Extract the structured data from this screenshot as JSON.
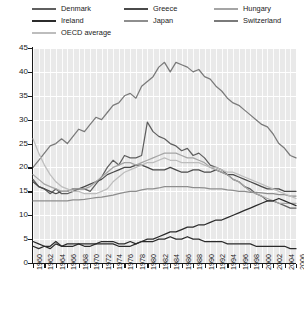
{
  "legend": {
    "columns": [
      [
        {
          "label": "Denmark",
          "color": "#5f5f5f",
          "key": "denmark"
        },
        {
          "label": "Ireland",
          "color": "#2b2b2b",
          "key": "ireland"
        },
        {
          "label": "OECD average",
          "color": "#bdbdbd",
          "key": "oecd_average"
        }
      ],
      [
        {
          "label": "Greece",
          "color": "#4a4a4a",
          "key": "greece"
        },
        {
          "label": "Japan",
          "color": "#8e8e8e",
          "key": "japan"
        }
      ],
      [
        {
          "label": "Hungary",
          "color": "#a5a5a5",
          "key": "hungary"
        },
        {
          "label": "Switzerland",
          "color": "#7a7a7a",
          "key": "switzerland"
        }
      ]
    ]
  },
  "chart_data": {
    "type": "line",
    "title": "",
    "xlabel": "",
    "ylabel": "",
    "xlim": [
      1960,
      2006
    ],
    "ylim": [
      0,
      45
    ],
    "ytick_step": 5,
    "yticks": [
      0,
      5,
      10,
      15,
      20,
      25,
      30,
      35,
      40,
      45
    ],
    "grid": true,
    "legend_position": "top",
    "x": [
      1960,
      1961,
      1962,
      1963,
      1964,
      1965,
      1966,
      1967,
      1968,
      1969,
      1970,
      1971,
      1972,
      1973,
      1974,
      1975,
      1976,
      1977,
      1978,
      1979,
      1980,
      1981,
      1982,
      1983,
      1984,
      1985,
      1986,
      1987,
      1988,
      1989,
      1990,
      1991,
      1992,
      1993,
      1994,
      1995,
      1996,
      1997,
      1998,
      1999,
      2000,
      2001,
      2002,
      2003,
      2004,
      2005,
      2006
    ],
    "xticks": [
      1960,
      1962,
      1964,
      1966,
      1968,
      1970,
      1972,
      1974,
      1976,
      1978,
      1980,
      1982,
      1984,
      1986,
      1988,
      1990,
      1992,
      1994,
      1996,
      1998,
      2000,
      2002,
      2004,
      2006
    ],
    "xtick_labels": [
      "1960",
      "1962",
      "1964",
      "1966",
      "1968",
      "1970",
      "1972",
      "1974",
      "1976",
      "1978",
      "1980",
      "1982",
      "1984",
      "1986",
      "1988",
      "1990",
      "1992",
      "1994",
      "1996",
      "1998",
      "2000",
      "2002",
      "2004",
      "2006"
    ],
    "series": [
      {
        "name": "Switzerland",
        "color": "#7a7a7a",
        "values": [
          20.0,
          21.5,
          23.0,
          24.5,
          25.0,
          26.0,
          25.0,
          26.5,
          28.0,
          27.5,
          29.0,
          30.5,
          30.0,
          31.5,
          33.0,
          33.5,
          35.0,
          35.5,
          34.5,
          37.0,
          38.0,
          39.0,
          41.0,
          42.0,
          40.0,
          42.0,
          41.5,
          41.0,
          40.0,
          40.5,
          39.0,
          38.5,
          37.0,
          36.0,
          34.5,
          33.5,
          33.0,
          32.0,
          31.0,
          30.0,
          29.0,
          28.5,
          27.0,
          25.0,
          24.0,
          22.5,
          22.0
        ]
      },
      {
        "name": "Denmark",
        "color": "#5f5f5f",
        "values": [
          17.5,
          16.0,
          15.5,
          14.5,
          15.5,
          14.5,
          14.5,
          15.0,
          15.5,
          15.5,
          15.0,
          16.5,
          18.0,
          20.0,
          21.5,
          20.5,
          22.5,
          22.0,
          22.0,
          22.5,
          29.5,
          27.5,
          26.5,
          26.0,
          25.0,
          24.5,
          23.5,
          24.0,
          22.5,
          23.0,
          22.0,
          20.5,
          20.0,
          19.5,
          18.5,
          17.5,
          17.0,
          16.0,
          15.5,
          14.5,
          14.0,
          13.0,
          13.0,
          12.5,
          12.0,
          11.5,
          11.5
        ]
      },
      {
        "name": "Greece",
        "color": "#4a4a4a",
        "values": [
          17.0,
          16.0,
          15.5,
          15.0,
          14.5,
          15.0,
          15.0,
          15.5,
          15.5,
          16.0,
          16.5,
          17.0,
          17.5,
          18.5,
          19.0,
          19.5,
          20.0,
          20.0,
          20.5,
          20.5,
          20.0,
          19.5,
          19.5,
          19.5,
          20.0,
          19.5,
          19.0,
          19.0,
          19.5,
          19.5,
          19.0,
          19.0,
          19.5,
          19.0,
          18.5,
          18.5,
          18.0,
          17.5,
          17.0,
          16.5,
          16.0,
          15.5,
          15.5,
          15.5,
          15.0,
          15.0,
          15.0
        ]
      },
      {
        "name": "Hungary",
        "color": "#a5a5a5",
        "values": [
          18.5,
          17.5,
          16.5,
          16.0,
          15.5,
          15.0,
          15.0,
          15.5,
          15.5,
          15.5,
          16.0,
          17.0,
          18.0,
          19.0,
          20.0,
          20.5,
          21.0,
          21.0,
          20.5,
          21.0,
          21.5,
          22.0,
          22.5,
          23.0,
          23.0,
          23.0,
          22.5,
          22.0,
          22.0,
          21.5,
          21.0,
          20.0,
          19.5,
          19.0,
          18.5,
          17.5,
          17.0,
          16.0,
          15.0,
          14.5,
          14.0,
          13.5,
          13.0,
          12.5,
          12.5,
          12.5,
          12.5
        ]
      },
      {
        "name": "Japan",
        "color": "#8e8e8e",
        "values": [
          13.0,
          13.0,
          13.0,
          13.0,
          13.0,
          13.0,
          13.0,
          13.2,
          13.2,
          13.3,
          13.5,
          13.7,
          13.8,
          14.0,
          14.2,
          14.5,
          14.8,
          15.0,
          15.0,
          15.3,
          15.5,
          15.5,
          15.7,
          16.0,
          16.0,
          16.0,
          16.0,
          16.0,
          15.8,
          15.8,
          15.7,
          15.5,
          15.5,
          15.5,
          15.3,
          15.2,
          15.0,
          15.0,
          14.8,
          14.8,
          14.7,
          14.5,
          14.5,
          14.3,
          14.3,
          14.0,
          14.0
        ]
      },
      {
        "name": "OECD average",
        "color": "#bdbdbd",
        "values": [
          26.0,
          23.0,
          20.5,
          18.5,
          17.0,
          16.0,
          15.5,
          15.0,
          15.0,
          14.5,
          14.5,
          14.5,
          15.0,
          15.5,
          17.0,
          18.0,
          19.0,
          19.5,
          20.0,
          20.5,
          21.0,
          21.0,
          21.5,
          22.0,
          21.5,
          21.5,
          21.0,
          21.0,
          21.0,
          21.0,
          20.5,
          20.0,
          20.0,
          19.5,
          19.0,
          19.0,
          18.5,
          18.0,
          17.5,
          17.0,
          16.5,
          16.0,
          15.5,
          15.0,
          14.5,
          14.0,
          13.5
        ]
      },
      {
        "name": "Ireland",
        "color": "#2b2b2b",
        "values": [
          3.5,
          3.0,
          3.5,
          3.0,
          4.0,
          3.5,
          3.5,
          3.5,
          4.0,
          3.5,
          3.5,
          4.0,
          4.0,
          4.0,
          4.0,
          3.5,
          3.5,
          3.5,
          4.0,
          4.5,
          5.0,
          5.0,
          5.5,
          6.0,
          6.5,
          6.5,
          7.0,
          7.5,
          7.5,
          8.0,
          8.0,
          8.5,
          9.0,
          9.0,
          9.5,
          10.0,
          10.5,
          11.0,
          11.5,
          12.0,
          12.5,
          13.0,
          13.0,
          13.5,
          13.0,
          12.5,
          12.0
        ]
      },
      {
        "name": "Ireland lower",
        "color": "#2b2b2b",
        "values": [
          4.5,
          4.0,
          3.5,
          3.5,
          4.5,
          3.5,
          4.0,
          4.0,
          4.0,
          4.0,
          4.0,
          4.0,
          4.5,
          4.5,
          4.5,
          4.0,
          4.0,
          4.5,
          4.0,
          4.5,
          4.5,
          4.5,
          5.0,
          5.0,
          5.5,
          5.0,
          5.0,
          5.5,
          5.0,
          5.0,
          4.5,
          4.5,
          4.5,
          4.5,
          4.0,
          4.0,
          4.0,
          4.0,
          4.0,
          3.5,
          3.5,
          3.5,
          3.5,
          3.5,
          3.5,
          3.0,
          3.0
        ]
      }
    ]
  }
}
